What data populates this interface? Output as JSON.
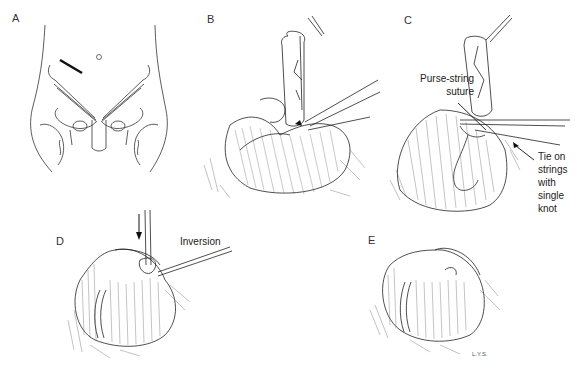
{
  "figure": {
    "panels": [
      {
        "id": "A",
        "label": "A",
        "description": "Lower abdomen with incision site"
      },
      {
        "id": "B",
        "label": "B",
        "description": "Appendix elevated with clamp applied at base"
      },
      {
        "id": "C",
        "label": "C",
        "description": "Purse-string suture placed around appendix base",
        "annotations": [
          "Purse-string suture",
          "Tie on strings with single knot"
        ]
      },
      {
        "id": "D",
        "label": "D",
        "description": "Stump inverted into cecum",
        "annotations": [
          "Inversion"
        ]
      },
      {
        "id": "E",
        "label": "E",
        "description": "Completed closure of cecum"
      }
    ],
    "annotation_text": {
      "purse_string_line1": "Purse-string",
      "purse_string_line2": "suture",
      "tie_line1": "Tie on",
      "tie_line2": "strings",
      "tie_line3": "with",
      "tie_line4": "single",
      "tie_line5": "knot",
      "inversion": "Inversion",
      "signature": "L.Y.S."
    }
  }
}
